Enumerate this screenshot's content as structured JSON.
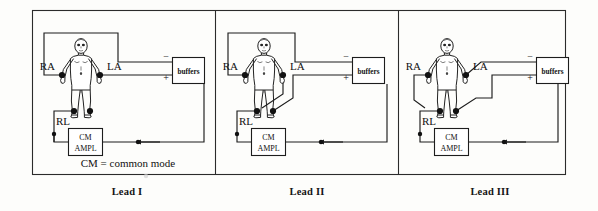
{
  "figure": {
    "title_caption": "CM = common mode",
    "outer_border_color": "#2b2b2b",
    "wire_color": "#1d1d1d",
    "electrode_color": "#111111",
    "background": "#fdfdfb"
  },
  "panels": [
    {
      "id": "lead-1",
      "caption": "Lead I",
      "electrodes": [
        {
          "name": "RA",
          "label": "RA",
          "polarity_target": "minus"
        },
        {
          "name": "LA",
          "label": "LA",
          "polarity_target": "plus"
        },
        {
          "name": "RL",
          "label": "RL",
          "polarity_target": "common"
        }
      ],
      "buffer_box": {
        "label": "buffers",
        "minus": "−",
        "plus": "+"
      },
      "cm_box": {
        "line1": "CM",
        "line2": "AMPL"
      },
      "note": "CM = common mode"
    },
    {
      "id": "lead-2",
      "caption": "Lead II",
      "electrodes": [
        {
          "name": "RA",
          "label": "RA",
          "polarity_target": "minus"
        },
        {
          "name": "LA",
          "label": "LA",
          "polarity_target": "none"
        },
        {
          "name": "RL",
          "label": "RL",
          "polarity_target": "common"
        }
      ],
      "buffer_box": {
        "label": "buffers",
        "minus": "−",
        "plus": "+"
      },
      "cm_box": {
        "line1": "CM",
        "line2": "AMPL"
      },
      "note": ""
    },
    {
      "id": "lead-3",
      "caption": "Lead III",
      "electrodes": [
        {
          "name": "RA",
          "label": "RA",
          "polarity_target": "none"
        },
        {
          "name": "LA",
          "label": "LA",
          "polarity_target": "minus"
        },
        {
          "name": "RL",
          "label": "RL",
          "polarity_target": "common"
        }
      ],
      "buffer_box": {
        "label": "buffers",
        "minus": "−",
        "plus": "+"
      },
      "cm_box": {
        "line1": "CM",
        "line2": "AMPL"
      },
      "note": ""
    }
  ]
}
